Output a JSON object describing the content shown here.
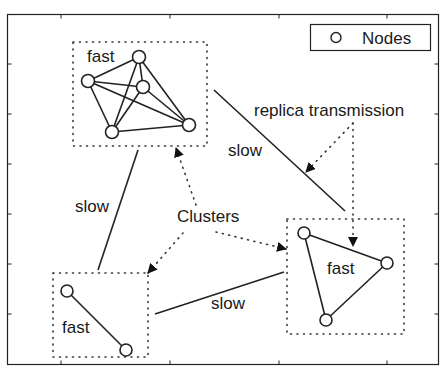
{
  "diagram": {
    "legend": {
      "marker": "circle",
      "label": "Nodes"
    },
    "annotations": {
      "replica_transmission": "replica transmission",
      "clusters": "Clusters"
    },
    "clusters": [
      {
        "id": "top-left",
        "label": "fast",
        "box": [
          73,
          42,
          207,
          146
        ],
        "nodes": [
          [
            88,
            81
          ],
          [
            139,
            57
          ],
          [
            143,
            87
          ],
          [
            112,
            132
          ],
          [
            189,
            125
          ]
        ],
        "edges": [
          [
            0,
            1
          ],
          [
            0,
            2
          ],
          [
            0,
            3
          ],
          [
            0,
            4
          ],
          [
            1,
            2
          ],
          [
            1,
            3
          ],
          [
            1,
            4
          ],
          [
            2,
            3
          ],
          [
            2,
            4
          ],
          [
            3,
            4
          ]
        ]
      },
      {
        "id": "bottom-left",
        "label": "fast",
        "box": [
          53,
          273,
          148,
          357
        ],
        "nodes": [
          [
            67,
            291
          ],
          [
            126,
            350
          ]
        ],
        "edges": [
          [
            0,
            1
          ]
        ]
      },
      {
        "id": "right",
        "label": "fast",
        "box": [
          287,
          219,
          404,
          334
        ],
        "nodes": [
          [
            304,
            233
          ],
          [
            387,
            263
          ],
          [
            326,
            320
          ]
        ],
        "edges": [
          [
            0,
            1
          ],
          [
            1,
            2
          ],
          [
            2,
            0
          ]
        ]
      }
    ],
    "links": [
      {
        "label": "slow",
        "from": [
          214,
          90
        ],
        "to": [
          345,
          211
        ]
      },
      {
        "label": "slow",
        "from": [
          138,
          150
        ],
        "to": [
          98,
          270
        ]
      },
      {
        "label": "slow",
        "from": [
          155,
          314
        ],
        "to": [
          284,
          272
        ]
      }
    ]
  }
}
